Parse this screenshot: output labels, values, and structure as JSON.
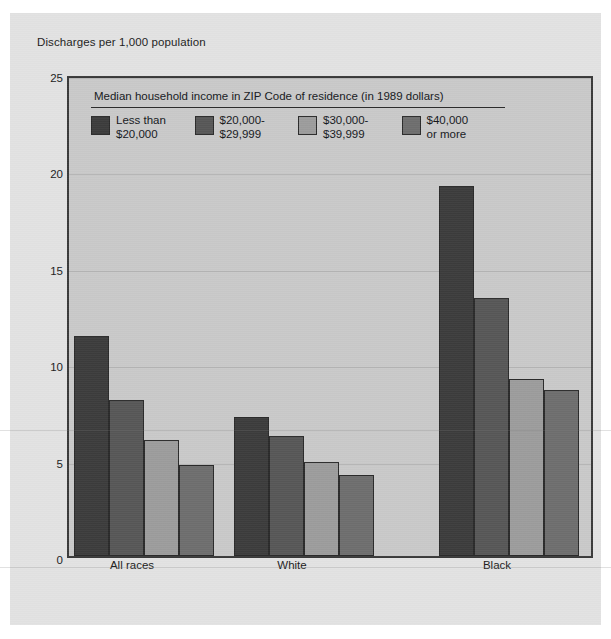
{
  "axis_caption": "Discharges per 1,000 population",
  "legend": {
    "title": "Median household income in ZIP Code of residence (in 1989 dollars)",
    "items": [
      {
        "line1": "Less than",
        "line2": "$20,000",
        "color": "#3c3c3c"
      },
      {
        "line1": "$20,000-",
        "line2": "$29,999",
        "color": "#575757"
      },
      {
        "line1": "$30,000-",
        "line2": "$39,999",
        "color": "#9c9c9c"
      },
      {
        "line1": "$40,000",
        "line2": "or more",
        "color": "#6e6e6e"
      }
    ]
  },
  "chart_data": {
    "type": "bar",
    "title": "",
    "xlabel": "",
    "ylabel": "Discharges per 1,000 population",
    "ylim": [
      0,
      25
    ],
    "yticks": [
      0,
      5,
      10,
      15,
      20,
      25
    ],
    "grid": true,
    "legend_position": "inside-top-left",
    "categories": [
      "All races",
      "White",
      "Black"
    ],
    "series": [
      {
        "name": "Less than $20,000",
        "color": "#3c3c3c",
        "values": [
          11.4,
          7.2,
          19.2
        ]
      },
      {
        "name": "$20,000-$29,999",
        "color": "#575757",
        "values": [
          8.1,
          6.2,
          13.4
        ]
      },
      {
        "name": "$30,000-$39,999",
        "color": "#9c9c9c",
        "values": [
          6.0,
          4.9,
          9.2
        ]
      },
      {
        "name": "$40,000 or more",
        "color": "#6e6e6e",
        "values": [
          4.7,
          4.2,
          8.6
        ]
      }
    ]
  },
  "colors": {
    "plot_background": "#c9c9c9",
    "panel_background": "#e2e2e2",
    "axis": "#3a3a3a",
    "gridline": "#b4b4b4"
  }
}
